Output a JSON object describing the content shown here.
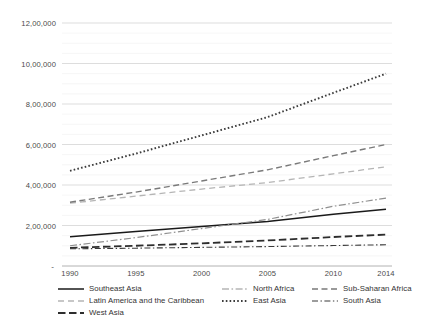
{
  "chart_data": {
    "type": "line",
    "title": "",
    "xlabel": "",
    "ylabel": "",
    "grid": true,
    "legend_position": "bottom",
    "x": [
      1990,
      1995,
      2000,
      2005,
      2010,
      2014
    ],
    "xtick_labels": [
      "1990",
      "1995",
      "2000",
      "2005",
      "2010",
      "2014"
    ],
    "xlim": [
      1990,
      2014
    ],
    "ylim": [
      0,
      1200000
    ],
    "ytick_labels": [
      "-",
      "2,00,000",
      "4,00,000",
      "6,00,000",
      "8,00,000",
      "10,00,000",
      "12,00,000"
    ],
    "ytick_values": [
      0,
      200000,
      400000,
      600000,
      800000,
      1000000,
      1200000
    ],
    "series": [
      {
        "name": "Southeast Asia",
        "style": "solid",
        "color": "#1a1a1a",
        "values": [
          145000,
          170000,
          195000,
          220000,
          255000,
          280000
        ]
      },
      {
        "name": "Latin America and the Caribbean",
        "style": "dashed-light",
        "color": "#b5b5b5",
        "values": [
          310000,
          345000,
          380000,
          412000,
          455000,
          490000
        ]
      },
      {
        "name": "West Asia",
        "style": "long-dash",
        "color": "#2d2d2d",
        "values": [
          90000,
          100000,
          112000,
          126000,
          143000,
          155000
        ]
      },
      {
        "name": "North Africa",
        "style": "dash-dot",
        "color": "#909090",
        "values": [
          100000,
          140000,
          185000,
          230000,
          295000,
          335000
        ]
      },
      {
        "name": "East Asia",
        "style": "dotted",
        "color": "#3c3c3c",
        "values": [
          470000,
          555000,
          645000,
          735000,
          855000,
          950000
        ]
      },
      {
        "name": "Sub-Saharan Africa",
        "style": "dashed",
        "color": "#7a7a7a",
        "values": [
          315000,
          365000,
          420000,
          475000,
          545000,
          600000
        ]
      },
      {
        "name": "South Asia",
        "style": "dash-dot-thin",
        "color": "#3a3a3a",
        "values": [
          85000,
          88000,
          92000,
          96000,
          101000,
          105000
        ]
      }
    ]
  },
  "legend": {
    "items": [
      {
        "label": "Southeast Asia"
      },
      {
        "label": "North Africa"
      },
      {
        "label": "Sub-Saharan Africa"
      },
      {
        "label": "Latin America and the Caribbean"
      },
      {
        "label": "East Asia"
      },
      {
        "label": "South Asia"
      },
      {
        "label": "West Asia"
      }
    ]
  }
}
